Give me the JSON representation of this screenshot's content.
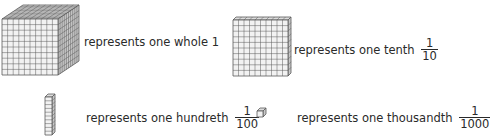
{
  "items": [
    {
      "block": "cube",
      "icon": "thousand-cube-icon",
      "text": "represents one whole",
      "value": "1",
      "fraction": null
    },
    {
      "block": "flat",
      "icon": "hundred-flat-icon",
      "text": "represents one tenth",
      "value": null,
      "fraction": {
        "numerator": "1",
        "denominator": "10"
      }
    },
    {
      "block": "rod",
      "icon": "ten-rod-icon",
      "text": "represents one hundreth",
      "value": null,
      "fraction": {
        "numerator": "1",
        "denominator": "100"
      }
    },
    {
      "block": "unit",
      "icon": "unit-cube-icon",
      "text": "represents one thousandth",
      "value": null,
      "fraction": {
        "numerator": "1",
        "denominator": "1000"
      }
    }
  ],
  "colors": {
    "face": "#f2f2f2",
    "top": "#dcdcdc",
    "side": "#c8c8c8",
    "line": "#5a5a5a",
    "text": "#2a2a2a"
  }
}
